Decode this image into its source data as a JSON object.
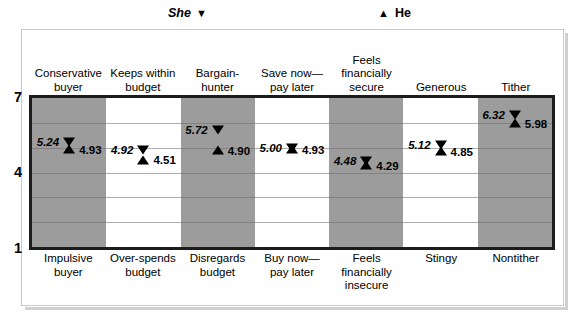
{
  "legend": {
    "she": {
      "label": "She",
      "marker": "▼",
      "marker_name": "triangle-down"
    },
    "he": {
      "label": "He",
      "marker": "▲",
      "marker_name": "triangle-up"
    }
  },
  "axis": {
    "ticks": [
      "7",
      "4",
      "1"
    ],
    "min": 1,
    "max": 7
  },
  "chart_data": {
    "type": "scatter",
    "title": "",
    "subtitle": "",
    "xlabel": "",
    "ylabel": "",
    "ylim": [
      1,
      7
    ],
    "yticks": [
      1,
      4,
      7
    ],
    "grid": true,
    "legend_position": "top",
    "orientation": "semantic-differential",
    "categories": [
      "Conservative buyer / Impulsive buyer",
      "Keeps within budget / Over-spends budget",
      "Bargain-hunter / Disregards budget",
      "Save now—pay later / Buy now—pay later",
      "Feels financially secure / Feels financially insecure",
      "Generous / Stingy",
      "Tither / Nontither"
    ],
    "top_labels": [
      "Conservative buyer",
      "Keeps within budget",
      "Bargain-hunter",
      "Save now—pay later",
      "Feels financially secure",
      "Generous",
      "Tither"
    ],
    "bottom_labels": [
      "Impulsive buyer",
      "Over-spends budget",
      "Disregards budget",
      "Buy now—pay later",
      "Feels financially insecure",
      "Stingy",
      "Nontither"
    ],
    "series": [
      {
        "name": "She",
        "marker": "triangle-down",
        "values": [
          5.24,
          4.92,
          5.72,
          5.0,
          4.48,
          5.12,
          6.32
        ],
        "value_labels": [
          "5.24",
          "4.92",
          "5.72",
          "5.00",
          "4.48",
          "5.12",
          "6.32"
        ]
      },
      {
        "name": "He",
        "marker": "triangle-up",
        "values": [
          4.93,
          4.51,
          4.9,
          4.93,
          4.29,
          4.85,
          5.98
        ],
        "value_labels": [
          "4.93",
          "4.51",
          "4.90",
          "4.93",
          "4.29",
          "4.85",
          "5.98"
        ]
      }
    ],
    "band_shading": [
      "shaded",
      "plain",
      "shaded",
      "plain",
      "shaded",
      "plain",
      "shaded"
    ]
  },
  "colors": {
    "band_shaded": "#9c9c9c",
    "band_plain": "#ffffff",
    "plot_border": "#1c1c1c",
    "gridline": "#6e6e6e",
    "text": "#000000",
    "card_border": "#c8c8c8"
  }
}
